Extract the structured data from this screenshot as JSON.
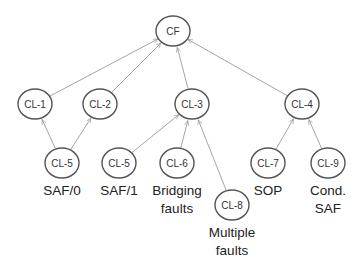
{
  "diagram": {
    "type": "fault-class hierarchy tree",
    "nodes": [
      {
        "id": "CF",
        "label": "CF",
        "x": 173,
        "y": 31
      },
      {
        "id": "CL-1",
        "label": "CL-1",
        "x": 35,
        "y": 104
      },
      {
        "id": "CL-2",
        "label": "CL-2",
        "x": 100,
        "y": 104
      },
      {
        "id": "CL-3",
        "label": "CL-3",
        "x": 192,
        "y": 104
      },
      {
        "id": "CL-4",
        "label": "CL-4",
        "x": 302,
        "y": 104
      },
      {
        "id": "CL-5a",
        "label": "CL-5",
        "x": 62,
        "y": 163,
        "caption": [
          "SAF/0"
        ]
      },
      {
        "id": "CL-5b",
        "label": "CL-5",
        "x": 119,
        "y": 163,
        "caption": [
          "SAF/1"
        ]
      },
      {
        "id": "CL-6",
        "label": "CL-6",
        "x": 177,
        "y": 163,
        "caption": [
          "Bridging",
          "faults"
        ]
      },
      {
        "id": "CL-8",
        "label": "CL-8",
        "x": 232,
        "y": 205,
        "caption": [
          "Multiple",
          "faults"
        ]
      },
      {
        "id": "CL-7",
        "label": "CL-7",
        "x": 268,
        "y": 163,
        "caption": [
          "SOP"
        ]
      },
      {
        "id": "CL-9",
        "label": "CL-9",
        "x": 328,
        "y": 163,
        "caption": [
          "Cond.",
          "SAF"
        ]
      }
    ],
    "edges": [
      {
        "from": "CL-1",
        "to": "CF"
      },
      {
        "from": "CL-2",
        "to": "CF"
      },
      {
        "from": "CL-3",
        "to": "CF"
      },
      {
        "from": "CL-4",
        "to": "CF"
      },
      {
        "from": "CL-5a",
        "to": "CL-1"
      },
      {
        "from": "CL-5a",
        "to": "CL-2"
      },
      {
        "from": "CL-5b",
        "to": "CL-3"
      },
      {
        "from": "CL-6",
        "to": "CL-3"
      },
      {
        "from": "CL-8",
        "to": "CL-3"
      },
      {
        "from": "CL-7",
        "to": "CL-4"
      },
      {
        "from": "CL-9",
        "to": "CL-4"
      }
    ],
    "node_radius": 16,
    "colors": {
      "edge": "#9a9a9a",
      "node_stroke": "#555555",
      "caption": "#222222"
    }
  }
}
